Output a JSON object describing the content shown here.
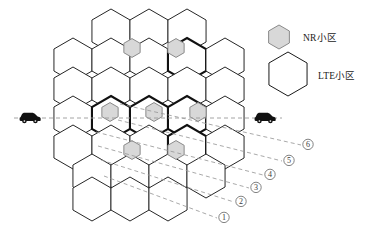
{
  "figure": {
    "title": ""
  },
  "colors": {
    "lte_stroke": "#1a1a1a",
    "lte_stroke_bold": "#111111",
    "lte_fill": "#ffffff",
    "nr_fill": "#d8d8d8",
    "nr_stroke": "#8a8a8a",
    "dashed_line": "#9a9a9a",
    "car": "#111111",
    "text": "#1a1a1a"
  },
  "legend": {
    "items": [
      {
        "key": "nr",
        "label": "NR小区",
        "shape": "small-hexagon",
        "fill": "#d8d8d8",
        "stroke": "#8a8a8a"
      },
      {
        "key": "lte",
        "label": "LTE小区",
        "shape": "large-hexagon",
        "fill": "#ffffff",
        "stroke": "#1a1a1a"
      }
    ]
  },
  "grid": {
    "hex_radius": 22,
    "rows": [
      {
        "row": 0,
        "y": 31,
        "xs": [
          111,
          149,
          187
        ]
      },
      {
        "row": 1,
        "y": 60,
        "xs": [
          73,
          111,
          149,
          187,
          225
        ]
      },
      {
        "row": 2,
        "y": 89,
        "xs": [
          73,
          111,
          149,
          187,
          225
        ]
      },
      {
        "row": 3,
        "y": 118,
        "xs": [
          73,
          111,
          149,
          187,
          225
        ]
      },
      {
        "row": 4,
        "y": 147,
        "xs": [
          73,
          111,
          149,
          187,
          225
        ]
      },
      {
        "row": 5,
        "y": 176,
        "xs": [
          92,
          130,
          168,
          206
        ]
      },
      {
        "row": 6,
        "y": 199,
        "xs": [
          92,
          130,
          168
        ]
      }
    ]
  },
  "nr_cells": [
    {
      "id": 1,
      "x": 132,
      "y": 48
    },
    {
      "id": 2,
      "x": 176,
      "y": 48
    },
    {
      "id": 3,
      "x": 110,
      "y": 112
    },
    {
      "id": 4,
      "x": 154,
      "y": 112
    },
    {
      "id": 5,
      "x": 198,
      "y": 112
    },
    {
      "id": 6,
      "x": 132,
      "y": 150
    },
    {
      "id": 7,
      "x": 176,
      "y": 150
    }
  ],
  "vehicles": [
    {
      "id": "car-left",
      "x": 30,
      "y": 116,
      "direction": "right"
    },
    {
      "id": "car-right",
      "x": 265,
      "y": 116,
      "direction": "right"
    }
  ],
  "trajectory": {
    "y": 118,
    "x_start": 14,
    "x_end": 282,
    "style": "dashed"
  },
  "callouts": [
    {
      "num": "①",
      "label": "1",
      "x": 224,
      "y": 220,
      "ax": 104,
      "ay": 176
    },
    {
      "num": "②",
      "label": "2",
      "x": 241,
      "y": 204,
      "ax": 101,
      "ay": 160
    },
    {
      "num": "③",
      "label": "3",
      "x": 256,
      "y": 190,
      "ax": 98,
      "ay": 146
    },
    {
      "num": "④",
      "label": "4",
      "x": 270,
      "y": 177,
      "ax": 96,
      "ay": 132
    },
    {
      "num": "⑤",
      "label": "5",
      "x": 289,
      "y": 163,
      "ax": 118,
      "ay": 120
    },
    {
      "num": "⑥",
      "label": "6",
      "x": 308,
      "y": 147,
      "ax": 120,
      "ay": 104
    }
  ]
}
